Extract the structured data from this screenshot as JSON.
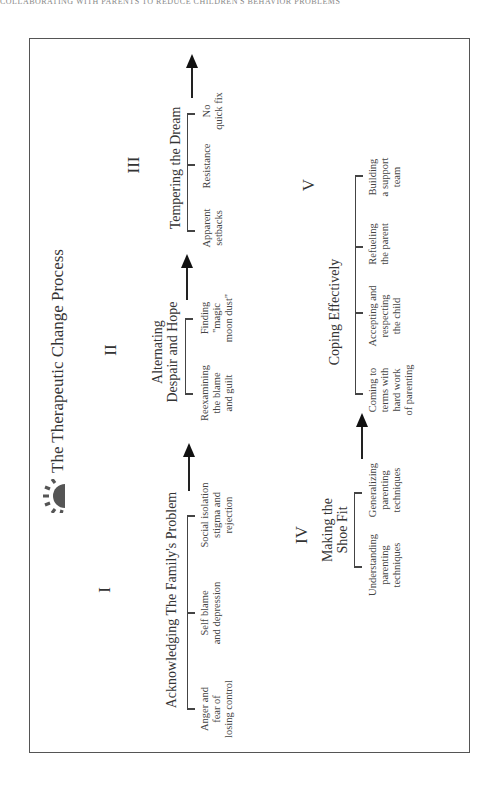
{
  "running_head": "COLLABORATING WITH PARENTS TO REDUCE CHILDREN'S BEHAVIOR PROBLEMS",
  "diagram": {
    "title": "The Therapeutic Change Process",
    "icon": "sunburst-icon",
    "colors": {
      "border": "#555555",
      "text": "#333333",
      "icon": "#555555",
      "arrow": "#111111"
    },
    "stages": [
      {
        "numeral": "I",
        "title": "Acknowledging The Family's Problem",
        "items": [
          {
            "lines": [
              "Anger and",
              "fear of",
              "losing control"
            ]
          },
          {
            "lines": [
              "Self blame",
              "and depression"
            ]
          },
          {
            "lines": [
              "Social isolation",
              "stigma and",
              "rejection"
            ]
          }
        ]
      },
      {
        "numeral": "II",
        "title_lines": [
          "Alternating",
          "Despair and Hope"
        ],
        "items": [
          {
            "lines": [
              "Reexamining",
              "the blame",
              "and guilt"
            ]
          },
          {
            "lines": [
              "Finding",
              "\"magic",
              "moon dust\""
            ]
          }
        ]
      },
      {
        "numeral": "III",
        "title": "Tempering the Dream",
        "items": [
          {
            "lines": [
              "Apparent",
              "setbacks"
            ]
          },
          {
            "lines": [
              "Resistance"
            ]
          },
          {
            "lines": [
              "No",
              "quick fix"
            ]
          }
        ]
      },
      {
        "numeral": "IV",
        "title_lines": [
          "Making the",
          "Shoe Fit"
        ],
        "items": [
          {
            "lines": [
              "Understanding",
              "parenting",
              "techniques"
            ]
          },
          {
            "lines": [
              "Generalizing",
              "parenting",
              "techniques"
            ]
          }
        ]
      },
      {
        "numeral": "V",
        "title": "Coping Effectively",
        "items": [
          {
            "lines": [
              "Coming to",
              "terms with",
              "hard work",
              "of parenting"
            ]
          },
          {
            "lines": [
              "Accepting and",
              "respecting",
              "the child"
            ]
          },
          {
            "lines": [
              "Refueling",
              "the parent"
            ]
          },
          {
            "lines": [
              "Building",
              "a support",
              "team"
            ]
          }
        ]
      }
    ]
  }
}
